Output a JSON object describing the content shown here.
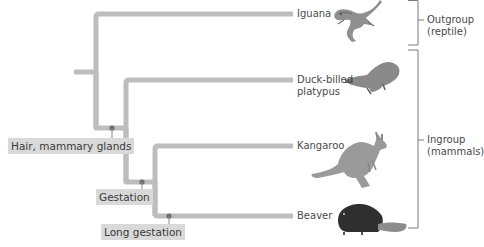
{
  "diagram": {
    "type": "cladogram",
    "colors": {
      "branch": "#bdbdbd",
      "node_dot": "#6f6f6f",
      "trait_bg": "#d9d9d9",
      "bracket": "#7a7a7a",
      "text": "#4a4a4a"
    },
    "taxa": [
      {
        "name": "Iguana",
        "icon": "iguana-illustration"
      },
      {
        "name": "Duck-billed\nplatypus",
        "line1": "Duck-billed",
        "line2": "platypus",
        "icon": "platypus-illustration"
      },
      {
        "name": "Kangaroo",
        "icon": "kangaroo-illustration"
      },
      {
        "name": "Beaver",
        "icon": "beaver-illustration"
      }
    ],
    "traits": [
      {
        "label": "Hair, mammary glands"
      },
      {
        "label": "Gestation"
      },
      {
        "label": "Long gestation"
      }
    ],
    "groups": [
      {
        "line1": "Outgroup",
        "line2": "(reptile)"
      },
      {
        "line1": "Ingroup",
        "line2": "(mammals)"
      }
    ]
  }
}
